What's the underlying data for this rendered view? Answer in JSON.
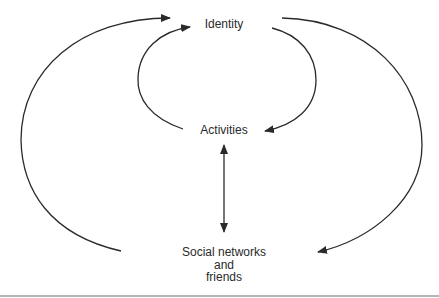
{
  "diagram": {
    "nodes": {
      "identity": {
        "label": "Identity"
      },
      "activities": {
        "label": "Activities"
      },
      "social": {
        "line1": "Social networks",
        "line2": "and",
        "line3": "friends"
      }
    },
    "edges": [
      {
        "from": "Social networks and friends",
        "to": "Identity",
        "side": "left-outer"
      },
      {
        "from": "Identity",
        "to": "Social networks and friends",
        "side": "right-outer"
      },
      {
        "from": "Activities",
        "to": "Identity",
        "side": "left-inner"
      },
      {
        "from": "Identity",
        "to": "Activities",
        "side": "right-inner"
      },
      {
        "from": "Activities",
        "to": "Social networks and friends",
        "bidirectional": true
      }
    ],
    "colors": {
      "stroke": "#2a2a2a",
      "rule": "#b5b5b5"
    }
  }
}
